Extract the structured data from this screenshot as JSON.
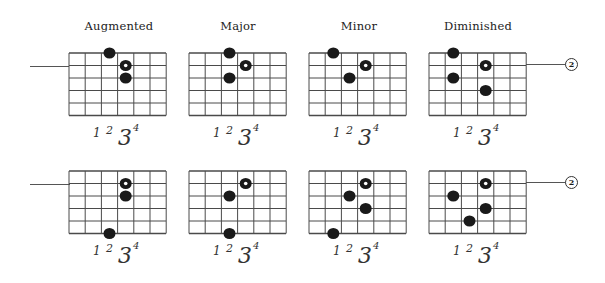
{
  "layout": {
    "fret_spaces": 6,
    "strings": 6,
    "cell_width": 16.2,
    "row_height": 12.5,
    "grid_width": 97,
    "grid_height": 62.5,
    "columns_x": [
      69,
      189,
      309,
      429
    ],
    "rows_y": [
      53,
      171
    ]
  },
  "titles": [
    "Augmented",
    "Major",
    "Minor",
    "Diminished"
  ],
  "finger_numbers": [
    "1",
    "2",
    "3",
    "4"
  ],
  "string_marker": {
    "label": "2",
    "string_index": 1
  },
  "rows": [
    {
      "diagrams": [
        {
          "name": "augmented-top",
          "dots": [
            {
              "fret": 2,
              "string": 0,
              "type": "solid"
            },
            {
              "fret": 3,
              "string": 1,
              "type": "ring"
            },
            {
              "fret": 3,
              "string": 2,
              "type": "solid"
            }
          ]
        },
        {
          "name": "major-top",
          "dots": [
            {
              "fret": 2,
              "string": 0,
              "type": "solid"
            },
            {
              "fret": 3,
              "string": 1,
              "type": "ring"
            },
            {
              "fret": 2,
              "string": 2,
              "type": "solid"
            }
          ]
        },
        {
          "name": "minor-top",
          "dots": [
            {
              "fret": 1,
              "string": 0,
              "type": "solid"
            },
            {
              "fret": 3,
              "string": 1,
              "type": "ring"
            },
            {
              "fret": 2,
              "string": 2,
              "type": "solid"
            }
          ]
        },
        {
          "name": "diminished-top",
          "dots": [
            {
              "fret": 1,
              "string": 0,
              "type": "solid"
            },
            {
              "fret": 3,
              "string": 1,
              "type": "ring"
            },
            {
              "fret": 1,
              "string": 2,
              "type": "solid"
            },
            {
              "fret": 3,
              "string": 3,
              "type": "solid"
            }
          ]
        }
      ]
    },
    {
      "diagrams": [
        {
          "name": "augmented-bottom",
          "dots": [
            {
              "fret": 3,
              "string": 1,
              "type": "ring"
            },
            {
              "fret": 3,
              "string": 2,
              "type": "solid"
            },
            {
              "fret": 2,
              "string": 5,
              "type": "solid"
            }
          ]
        },
        {
          "name": "major-bottom",
          "dots": [
            {
              "fret": 3,
              "string": 1,
              "type": "ring"
            },
            {
              "fret": 2,
              "string": 2,
              "type": "solid"
            },
            {
              "fret": 2,
              "string": 5,
              "type": "solid"
            }
          ]
        },
        {
          "name": "minor-bottom",
          "dots": [
            {
              "fret": 3,
              "string": 1,
              "type": "ring"
            },
            {
              "fret": 2,
              "string": 2,
              "type": "solid"
            },
            {
              "fret": 3,
              "string": 3,
              "type": "solid"
            },
            {
              "fret": 1,
              "string": 5,
              "type": "solid"
            }
          ]
        },
        {
          "name": "diminished-bottom",
          "dots": [
            {
              "fret": 3,
              "string": 1,
              "type": "ring"
            },
            {
              "fret": 1,
              "string": 2,
              "type": "solid"
            },
            {
              "fret": 3,
              "string": 3,
              "type": "solid"
            },
            {
              "fret": 2,
              "string": 4,
              "type": "solid"
            }
          ]
        }
      ]
    }
  ],
  "colors": {
    "grid_line": "#4a4a4a",
    "dot": "#1a1a1a",
    "ring_center": "#ffffff",
    "background": "#ffffff"
  }
}
